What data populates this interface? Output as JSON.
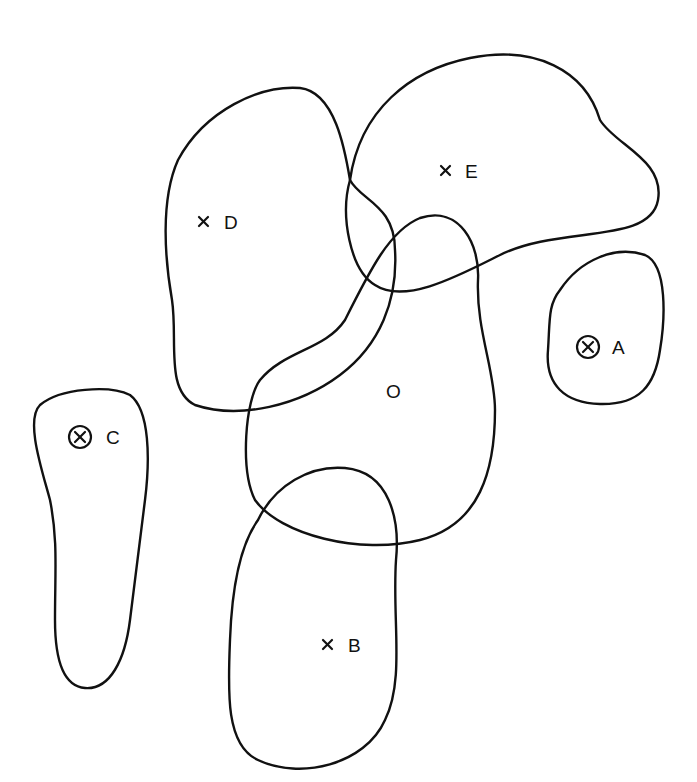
{
  "diagram": {
    "type": "overlapping-regions",
    "regions": [
      {
        "id": "O",
        "label": "O",
        "marker": "none"
      },
      {
        "id": "A",
        "label": "A",
        "marker": "circled-x"
      },
      {
        "id": "B",
        "label": "B",
        "marker": "x"
      },
      {
        "id": "C",
        "label": "C",
        "marker": "circled-x"
      },
      {
        "id": "D",
        "label": "D",
        "marker": "x"
      },
      {
        "id": "E",
        "label": "E",
        "marker": "x"
      }
    ],
    "overlaps": [
      [
        "O",
        "D"
      ],
      [
        "O",
        "E"
      ],
      [
        "O",
        "B"
      ],
      [
        "D",
        "E"
      ]
    ],
    "separate": [
      "A",
      "C"
    ]
  }
}
